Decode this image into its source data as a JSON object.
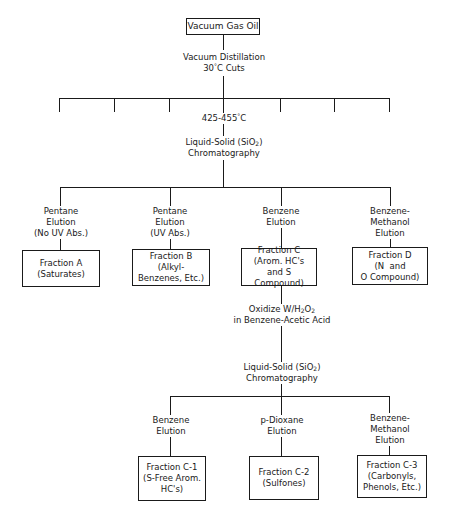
{
  "diagram": {
    "type": "flowchart",
    "root": {
      "label": "Vacuum Gas Oil"
    },
    "step1": {
      "line1": "Vacuum Distillation",
      "line2_pre": "30",
      "line2_deg": "°",
      "line2_post": "C Cuts"
    },
    "cut_selected": {
      "pre": "425-455",
      "deg": "°",
      "post": "C"
    },
    "distillation_cut_count": 7,
    "step2": {
      "line1_pre": "Liquid-Solid (SiO",
      "line1_sub": "2",
      "line1_post": ")",
      "line2": "Chromatography"
    },
    "elutions_level1": [
      {
        "line1": "Pentane",
        "line2": "Elution",
        "line3": "(No UV Abs.)"
      },
      {
        "line1": "Pentane",
        "line2": "Elution",
        "line3": "(UV Abs.)"
      },
      {
        "line1": "Benzene",
        "line2": "Elution",
        "line3": ""
      },
      {
        "line1": "Benzene-",
        "line2": "Methanol",
        "line3": "Elution"
      }
    ],
    "fractions_level1": [
      {
        "line1": "Fraction A",
        "line2": "(Saturates)",
        "line3": ""
      },
      {
        "line1": "Fraction B",
        "line2": "(Alkyl-",
        "line3": "Benzenes, Etc.)"
      },
      {
        "line1": "Fraction C",
        "line2": "(Arom. HC's",
        "line3": "and S Compound)"
      },
      {
        "line1": "Fraction D",
        "line2": "(N  and",
        "line3": "O Compound)"
      }
    ],
    "step3": {
      "line1_pre": "Oxidize W/H",
      "line1_sub1": "2",
      "line1_mid": "O",
      "line1_sub2": "2",
      "line2": "in Benzene-Acetic Acid"
    },
    "step4": {
      "line1_pre": "Liquid-Solid (SiO",
      "line1_sub": "2",
      "line1_post": ")",
      "line2": "Chromatography"
    },
    "elutions_level2": [
      {
        "line1": "Benzene",
        "line2": "Elution",
        "line3": ""
      },
      {
        "line1": "p-Dioxane",
        "line2": "Elution",
        "line3": ""
      },
      {
        "line1": "Benzene-",
        "line2": "Methanol",
        "line3": "Elution"
      }
    ],
    "fractions_level2": [
      {
        "line1": "Fraction C-1",
        "line2": "(S-Free Arom.",
        "line3": "HC's)"
      },
      {
        "line1": "Fraction C-2",
        "line2": "(Sulfones)",
        "line3": ""
      },
      {
        "line1": "Fraction C-3",
        "line2": "(Carbonyls,",
        "line3": "Phenols, Etc.)"
      }
    ]
  }
}
